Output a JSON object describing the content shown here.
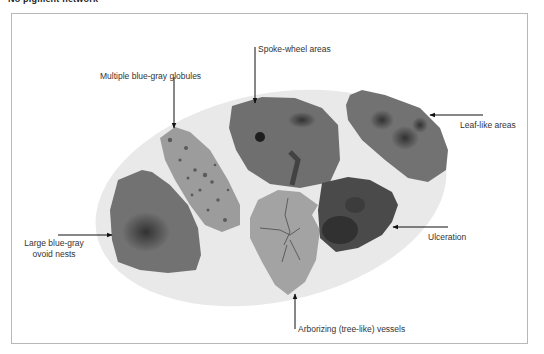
{
  "header": {
    "cropped_text": "No pigment network"
  },
  "figure": {
    "type": "dermoscopy-feature-diagram",
    "background_ellipse_color": "#e9e9e9",
    "lesion_colors": {
      "globules": "#9a9a9a",
      "spoke_wheel": "#6e6e6e",
      "leaf_like": "#707070",
      "ovoid_nests": "#727272",
      "arborizing": "#a3a3a3",
      "ulceration": "#4a4a4a"
    },
    "labels": {
      "globules": "Multiple blue-gray globules",
      "spoke_wheel": "Spoke-wheel areas",
      "leaf_like": "Leaf-like areas",
      "ulceration": "Ulceration",
      "ovoid_nests_line1": "Large blue-gray",
      "ovoid_nests_line2": "ovoid nests",
      "arborizing": "Arborizing (tree-like) vessels"
    }
  }
}
